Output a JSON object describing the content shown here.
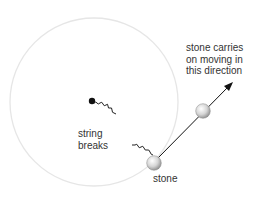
{
  "diagram": {
    "labels": {
      "direction": [
        "stone carries",
        "on moving in",
        "this direction"
      ],
      "string_breaks": [
        "string",
        "breaks"
      ],
      "stone": "stone"
    },
    "colors": {
      "circle_path": "#e8e8e8",
      "pivot": "#111111",
      "string": "#222222",
      "arrow": "#111111",
      "stone_fill": "#d0d0d0",
      "text": "#333333"
    },
    "geometry": {
      "circle_center": [
        94,
        102
      ],
      "circle_radius": 84,
      "pivot": [
        92,
        101
      ],
      "stone_at_break": [
        154,
        163
      ],
      "stone_later": [
        203,
        111
      ],
      "arrow_tip": [
        233,
        82
      ]
    }
  }
}
